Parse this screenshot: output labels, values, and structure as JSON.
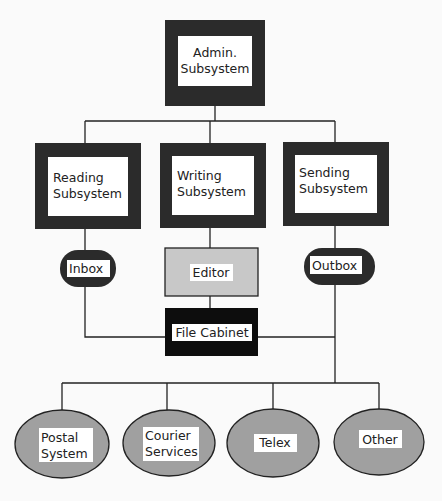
{
  "diagram": {
    "admin": {
      "line1": "Admin.",
      "line2": "Subsystem"
    },
    "subsystems": [
      {
        "id": "reading",
        "line1": "Reading",
        "line2": "Subsystem"
      },
      {
        "id": "writing",
        "line1": "Writing",
        "line2": "Subsystem"
      },
      {
        "id": "sending",
        "line1": "Sending",
        "line2": "Subsystem"
      }
    ],
    "inbox": "Inbox",
    "editor": "Editor",
    "outbox": "Outbox",
    "file_cabinet": "File Cabinet",
    "destinations": [
      {
        "line1": "Postal",
        "line2": "System"
      },
      {
        "line1": "Courier",
        "line2": "Services"
      },
      {
        "line1": "Telex",
        "line2": ""
      },
      {
        "line1": "Other",
        "line2": ""
      }
    ],
    "colors": {
      "frame": "#2b2b2b",
      "editor_fill": "#c8c8c8",
      "file_cabinet_fill": "#0d0d0d",
      "ellipse_fill": "#a0a0a0",
      "line": "#222222"
    }
  }
}
